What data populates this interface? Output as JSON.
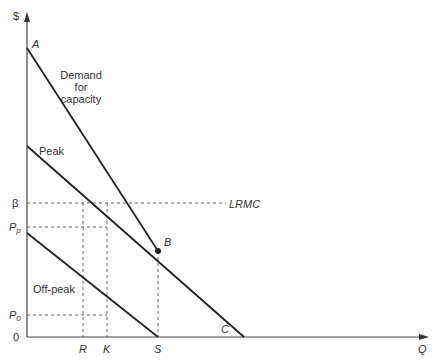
{
  "diagram": {
    "type": "peak-load pricing diagram",
    "axes": {
      "y_label": "$",
      "x_label": "Q",
      "origin_label": "0"
    },
    "y_ticks": [
      {
        "id": "beta",
        "label": "β",
        "y": 203
      },
      {
        "id": "pp",
        "label": "P",
        "sub": "p",
        "y": 227
      },
      {
        "id": "p0",
        "label": "P",
        "sub": "0",
        "y": 315
      }
    ],
    "x_ticks": [
      {
        "id": "R",
        "label": "R",
        "x": 83
      },
      {
        "id": "K",
        "label": "K",
        "x": 107
      },
      {
        "id": "S",
        "label": "S",
        "x": 158
      }
    ],
    "points": {
      "A": {
        "label": "A",
        "x": 27,
        "y": 48
      },
      "B": {
        "label": "B",
        "x": 158,
        "y": 251
      },
      "C": {
        "label": "C",
        "x": 244,
        "y": 337
      }
    },
    "curves": [
      {
        "id": "demand-for-capacity",
        "label_lines": [
          "Demand",
          "for",
          "capacity"
        ],
        "from": [
          27,
          48
        ],
        "to": [
          158,
          251
        ]
      },
      {
        "id": "peak",
        "label": "Peak",
        "from": [
          27,
          146
        ],
        "to": [
          244,
          337
        ]
      },
      {
        "id": "off-peak",
        "label": "Off-peak",
        "from": [
          27,
          233
        ],
        "to": [
          158,
          337
        ]
      }
    ],
    "lrmc": {
      "label": "LRMC",
      "y": 203
    }
  }
}
